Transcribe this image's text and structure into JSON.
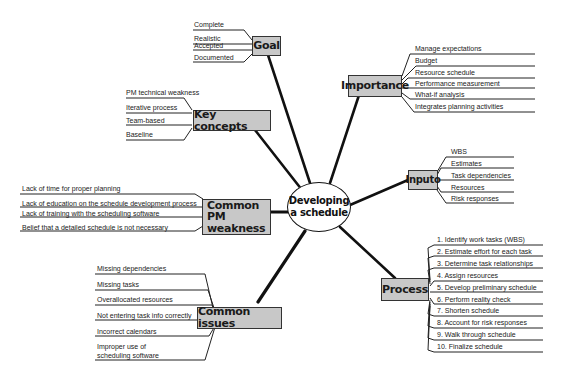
{
  "center": {
    "line1": "Developing",
    "line2": "a schedule"
  },
  "branches": {
    "goal": {
      "label": "Goal",
      "items": [
        "Complete",
        "Realistic",
        "Accepted",
        "Documented"
      ]
    },
    "importance": {
      "label": "Importance",
      "items": [
        "Manage expectations",
        "Budget",
        "Resource schedule",
        "Performance measurement",
        "What-if analysis",
        "Integrates planning activities"
      ]
    },
    "key_concepts": {
      "label": "Key concepts",
      "items": [
        "PM technical weakness",
        "Iterative process",
        "Team-based",
        "Baseline"
      ]
    },
    "inputs": {
      "label": "Inputo",
      "items": [
        "WBS",
        "Estimates",
        "Task dependencies",
        "Resources",
        "Risk responses"
      ]
    },
    "common_pm_weakness": {
      "label_line1": "Common PM",
      "label_line2": "weakness",
      "items": [
        "Lack of time for proper planning",
        "Lack of education on the schedule development process",
        "Lack of training with the scheduling software",
        "Belief that a detailed schedule is not necessary"
      ]
    },
    "process": {
      "label": "Process",
      "items": [
        "1. Identify work tasks (WBS)",
        "2. Estimate effort for each task",
        "3. Determine task relationships",
        "4. Assign resources",
        "5. Develop preliminary schedule",
        "6. Perform reality check",
        "7. Shorten schedule",
        "8. Account for risk responses",
        "9. Walk through schedule",
        "10. Finalize schedule"
      ]
    },
    "common_issues": {
      "label": "Common issues",
      "items": [
        "Missing dependencies",
        "Missing tasks",
        "Overallocated resources",
        "Not entering task info correctly",
        "Incorrect calendars",
        "Improper use of",
        "scheduling software"
      ]
    }
  },
  "colors": {
    "box_fill": "#c8c8c8",
    "line": "#111111",
    "text": "#222222",
    "background": "#ffffff"
  }
}
